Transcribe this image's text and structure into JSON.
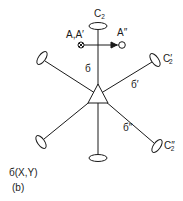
{
  "figure": {
    "caption_symmetry": "б(X,Y)",
    "panel_label": "(b)",
    "colors": {
      "ink": "#1a1a1a",
      "background": "#ffffff"
    },
    "center_symbol": "triangle (C3 axis)",
    "axes": [
      {
        "id": "C2",
        "label_main": "C",
        "label_sub": "2",
        "label_prime": "",
        "plane_label": "б"
      },
      {
        "id": "C2prime",
        "label_main": "C",
        "label_sub": "2",
        "label_prime": "′",
        "plane_label": "б′"
      },
      {
        "id": "C2doubleprime",
        "label_main": "C",
        "label_sub": "2",
        "label_prime": "″",
        "plane_label": "б″"
      }
    ],
    "atoms": {
      "start_label": "A,A′",
      "start_symbol": "⊗",
      "end_label": "A″",
      "end_symbol": "○"
    }
  }
}
